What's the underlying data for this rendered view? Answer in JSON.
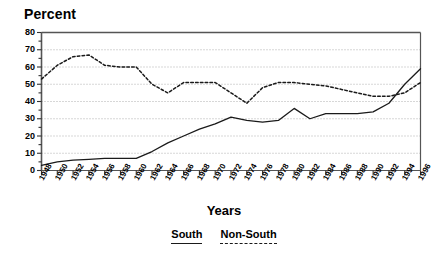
{
  "chart_data": {
    "type": "line",
    "title": "",
    "ylabel": "Percent",
    "xlabel": "Years",
    "ylim": [
      0,
      80
    ],
    "ytick_step": 10,
    "yticks": [
      0,
      10,
      20,
      30,
      40,
      50,
      60,
      70,
      80
    ],
    "grid": true,
    "grid_axis": "y",
    "legend_position": "bottom-center",
    "x": [
      1948,
      1950,
      1952,
      1954,
      1956,
      1958,
      1960,
      1962,
      1964,
      1966,
      1968,
      1970,
      1972,
      1974,
      1976,
      1978,
      1980,
      1982,
      1984,
      1986,
      1988,
      1990,
      1992,
      1994,
      1996
    ],
    "categories": [
      "1948",
      "1950",
      "1952",
      "1954",
      "1956",
      "1958",
      "1960",
      "1962",
      "1964",
      "1966",
      "1968",
      "1970",
      "1972",
      "1974",
      "1976",
      "1978",
      "1980",
      "1982",
      "1984",
      "1986",
      "1988",
      "1990",
      "1992",
      "1994",
      "1996"
    ],
    "series": [
      {
        "name": "South",
        "style": "solid",
        "color": "#1a1a1a",
        "values": [
          3,
          5,
          6,
          6.5,
          7,
          7,
          7,
          11,
          16,
          20,
          24,
          27,
          31,
          29,
          28,
          29,
          36,
          30,
          33,
          33,
          33,
          34,
          39,
          50,
          59
        ]
      },
      {
        "name": "Non-South",
        "style": "dashed",
        "color": "#1a1a1a",
        "values": [
          53,
          61,
          66,
          67,
          61,
          60,
          60,
          50,
          45,
          51,
          51,
          51,
          45,
          39,
          48,
          51,
          51,
          50,
          49,
          47,
          45,
          43,
          43,
          45,
          51
        ]
      }
    ]
  },
  "axes": {
    "ylabel": "Percent",
    "xlabel": "Years",
    "ytick_labels": [
      "80",
      "70",
      "60",
      "50",
      "40",
      "30",
      "20",
      "10",
      "0"
    ],
    "xtick_labels": [
      "1948",
      "1950",
      "1952",
      "1954",
      "1956",
      "1958",
      "1960",
      "1962",
      "1964",
      "1966",
      "1968",
      "1970",
      "1972",
      "1974",
      "1976",
      "1978",
      "1980",
      "1982",
      "1984",
      "1986",
      "1988",
      "1990",
      "1992",
      "1994",
      "1996"
    ]
  },
  "legend": {
    "items": [
      {
        "label": "South",
        "style": "solid"
      },
      {
        "label": "Non-South",
        "style": "dashed"
      }
    ]
  },
  "colors": {
    "line": "#1a1a1a",
    "grid": "#9a9a9a",
    "frame": "#555555",
    "background": "#ffffff"
  }
}
